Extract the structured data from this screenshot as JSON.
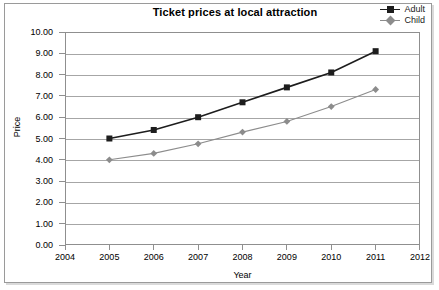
{
  "chart_data": {
    "type": "line",
    "title": "Ticket prices at local attraction",
    "xlabel": "Year",
    "ylabel": "Price",
    "x": [
      2005,
      2006,
      2007,
      2008,
      2009,
      2010,
      2011
    ],
    "xlim": [
      2004,
      2012
    ],
    "ylim": [
      0,
      10
    ],
    "ytick_step": 1,
    "xtick_step": 1,
    "xticklabels": [
      "2004",
      "2005",
      "2006",
      "2007",
      "2008",
      "2009",
      "2010",
      "2011",
      "2012"
    ],
    "yticklabels": [
      "0.00",
      "1.00",
      "2.00",
      "3.00",
      "4.00",
      "5.00",
      "6.00",
      "7.00",
      "8.00",
      "9.00",
      "10.00"
    ],
    "grid": "horizontal",
    "legend_position": "top-right-outside",
    "series": [
      {
        "name": "Adult",
        "color": "#1d1d1d",
        "marker": "square",
        "values": [
          5.0,
          5.4,
          6.0,
          6.7,
          7.4,
          8.1,
          9.1
        ]
      },
      {
        "name": "Child",
        "color": "#8c8c8c",
        "marker": "diamond",
        "values": [
          4.0,
          4.3,
          4.75,
          5.3,
          5.8,
          6.5,
          7.3
        ]
      }
    ]
  },
  "legend": {
    "items": [
      {
        "label": "Adult"
      },
      {
        "label": "Child"
      }
    ]
  },
  "colors": {
    "adult": "#1d1d1d",
    "child": "#8c8c8c",
    "grid": "#a6a6a6",
    "axis": "#8f8f8f",
    "frame": "#9a9a9a",
    "text": "#000000",
    "background": "#ffffff"
  }
}
